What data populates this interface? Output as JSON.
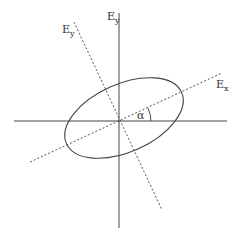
{
  "diagram": {
    "type": "polarization-ellipse",
    "labels": {
      "ey_axis": "E",
      "ey_axis_sub": "y",
      "ey_rotated": "E",
      "ey_rotated_sub": "y",
      "ex_rotated": "E",
      "ex_rotated_sub": "x",
      "angle": "α"
    },
    "colors": {
      "line": "#444444",
      "dashed": "#555555",
      "background": "#ffffff"
    }
  }
}
